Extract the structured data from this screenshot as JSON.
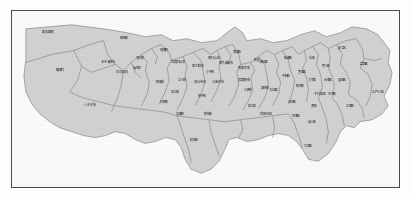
{
  "page": {
    "background_color": "#fdfdfd",
    "frame_color": "#4a4a4a",
    "map_fill_color": "#d2d2d2",
    "map_border_color": "#6d6d6d",
    "label_color": "#1d1d1d",
    "water_color": "#fbfbfb"
  },
  "map": {
    "title": "東京都",
    "type": "administrative-boundary-map",
    "regions": [
      {
        "name": "奥多摩町",
        "x": 36,
        "y": 22
      },
      {
        "name": "青梅市",
        "x": 112,
        "y": 28
      },
      {
        "name": "瑞穂町",
        "x": 152,
        "y": 40
      },
      {
        "name": "羽村市",
        "x": 128,
        "y": 48
      },
      {
        "name": "福生市",
        "x": 125,
        "y": 58
      },
      {
        "name": "武蔵村山市",
        "x": 166,
        "y": 52
      },
      {
        "name": "東大和市",
        "x": 186,
        "y": 56
      },
      {
        "name": "東村山市",
        "x": 202,
        "y": 48
      },
      {
        "name": "清瀬市",
        "x": 225,
        "y": 42
      },
      {
        "name": "東久留米市",
        "x": 214,
        "y": 53
      },
      {
        "name": "西東京市",
        "x": 232,
        "y": 58
      },
      {
        "name": "新座",
        "x": 245,
        "y": 50
      },
      {
        "name": "小平市",
        "x": 198,
        "y": 62
      },
      {
        "name": "あきる野市",
        "x": 96,
        "y": 52
      },
      {
        "name": "檜原村",
        "x": 48,
        "y": 60
      },
      {
        "name": "日の出町",
        "x": 110,
        "y": 62
      },
      {
        "name": "八王子市",
        "x": 78,
        "y": 95
      },
      {
        "name": "昭島市",
        "x": 148,
        "y": 72
      },
      {
        "name": "立川市",
        "x": 170,
        "y": 70
      },
      {
        "name": "国立市",
        "x": 163,
        "y": 82
      },
      {
        "name": "国分寺市",
        "x": 188,
        "y": 72
      },
      {
        "name": "小金井市",
        "x": 206,
        "y": 72
      },
      {
        "name": "武蔵野市",
        "x": 232,
        "y": 70
      },
      {
        "name": "三鷹市",
        "x": 236,
        "y": 80
      },
      {
        "name": "調布市",
        "x": 253,
        "y": 78
      },
      {
        "name": "府中市",
        "x": 190,
        "y": 86
      },
      {
        "name": "狛江市",
        "x": 240,
        "y": 96
      },
      {
        "name": "日野市",
        "x": 152,
        "y": 92
      },
      {
        "name": "多摩市",
        "x": 168,
        "y": 104
      },
      {
        "name": "稲城市",
        "x": 196,
        "y": 104
      },
      {
        "name": "町田市",
        "x": 182,
        "y": 130
      },
      {
        "name": "練馬区",
        "x": 252,
        "y": 52
      },
      {
        "name": "杉並区",
        "x": 262,
        "y": 80
      },
      {
        "name": "中野区",
        "x": 274,
        "y": 66
      },
      {
        "name": "板橋区",
        "x": 276,
        "y": 48
      },
      {
        "name": "豊島区",
        "x": 290,
        "y": 62
      },
      {
        "name": "北区",
        "x": 300,
        "y": 48
      },
      {
        "name": "足立区",
        "x": 330,
        "y": 38
      },
      {
        "name": "葛飾区",
        "x": 352,
        "y": 54
      },
      {
        "name": "荒川区",
        "x": 314,
        "y": 56
      },
      {
        "name": "文京区",
        "x": 300,
        "y": 70
      },
      {
        "name": "台東区",
        "x": 316,
        "y": 70
      },
      {
        "name": "墨田区",
        "x": 330,
        "y": 70
      },
      {
        "name": "江戸川区",
        "x": 366,
        "y": 82
      },
      {
        "name": "新宿区",
        "x": 288,
        "y": 76
      },
      {
        "name": "千代田区",
        "x": 308,
        "y": 84
      },
      {
        "name": "中央区",
        "x": 320,
        "y": 84
      },
      {
        "name": "渋谷区",
        "x": 280,
        "y": 92
      },
      {
        "name": "港区",
        "x": 302,
        "y": 96
      },
      {
        "name": "江東区",
        "x": 338,
        "y": 96
      },
      {
        "name": "世田谷区",
        "x": 254,
        "y": 104
      },
      {
        "name": "目黒区",
        "x": 284,
        "y": 106
      },
      {
        "name": "品川区",
        "x": 300,
        "y": 112
      },
      {
        "name": "大田区",
        "x": 296,
        "y": 136
      }
    ]
  }
}
